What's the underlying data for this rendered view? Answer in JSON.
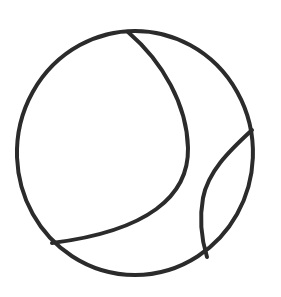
{
  "artwork": {
    "title": "Tennis Ball Outline",
    "subject": "tennis-ball",
    "style": "line-drawing",
    "background_color": "#ffffff",
    "stroke_color": "#2b2b2b",
    "stroke_width": 4,
    "canvas": {
      "width": 281,
      "height": 297
    }
  },
  "shapes": {
    "outer_circle": {
      "name": "ball-outline",
      "type": "circle",
      "center_x": 135,
      "center_y": 153,
      "radius_x": 118,
      "radius_y": 122,
      "path": "M 135 31 A 118 122 0 1 1 134.9 31 Z"
    },
    "seam_large": {
      "name": "left-seam-curve",
      "type": "arc",
      "start_x": 128,
      "start_y": 32,
      "end_x": 52,
      "end_y": 243,
      "bulge_x": 188,
      "bulge_y": 150,
      "path": "M 128 32 C 163 62 187 105 188 148 C 189 196 148 231 52 243"
    },
    "seam_small": {
      "name": "right-seam-curve",
      "type": "arc",
      "start_x": 252,
      "start_y": 130,
      "end_x": 207,
      "end_y": 257,
      "bulge_x": 202,
      "bulge_y": 196,
      "path": "M 252 130 C 228 152 208 172 203 198 C 199 220 202 241 207 257"
    }
  }
}
